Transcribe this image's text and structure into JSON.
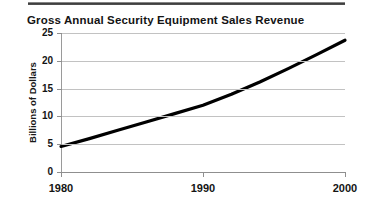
{
  "figure": {
    "top_rule": "horizontal-rule",
    "background_color": "#ffffff",
    "ink_color": "#141414",
    "grid_color": "#c2c2c2"
  },
  "chart_data": {
    "type": "line",
    "title": "Gross Annual Security Equipment Sales Revenue",
    "xlabel": "",
    "ylabel": "Billions of Dollars",
    "xlim": [
      1980,
      2000
    ],
    "ylim": [
      0,
      25
    ],
    "grid": true,
    "legend": "none",
    "xticks": [
      1980,
      1990,
      2000
    ],
    "xtick_labels": [
      "1980",
      "1990",
      "2000"
    ],
    "yticks": [
      0,
      5,
      10,
      15,
      20,
      25
    ],
    "ytick_labels": [
      "0",
      "5",
      "10",
      "15",
      "20",
      "25"
    ],
    "x": [
      1980,
      1982,
      1984,
      1986,
      1988,
      1990,
      1992,
      1994,
      1996,
      1998,
      2000
    ],
    "values": [
      4.6,
      6.0,
      7.5,
      9.0,
      10.5,
      12.0,
      14.0,
      16.2,
      18.6,
      21.1,
      23.7
    ],
    "series": [
      {
        "name": "Gross Annual Security Equipment Sales Revenue",
        "values": [
          4.6,
          6.0,
          7.5,
          9.0,
          10.5,
          12.0,
          14.0,
          16.2,
          18.6,
          21.1,
          23.7
        ],
        "color": "#000000"
      }
    ]
  }
}
